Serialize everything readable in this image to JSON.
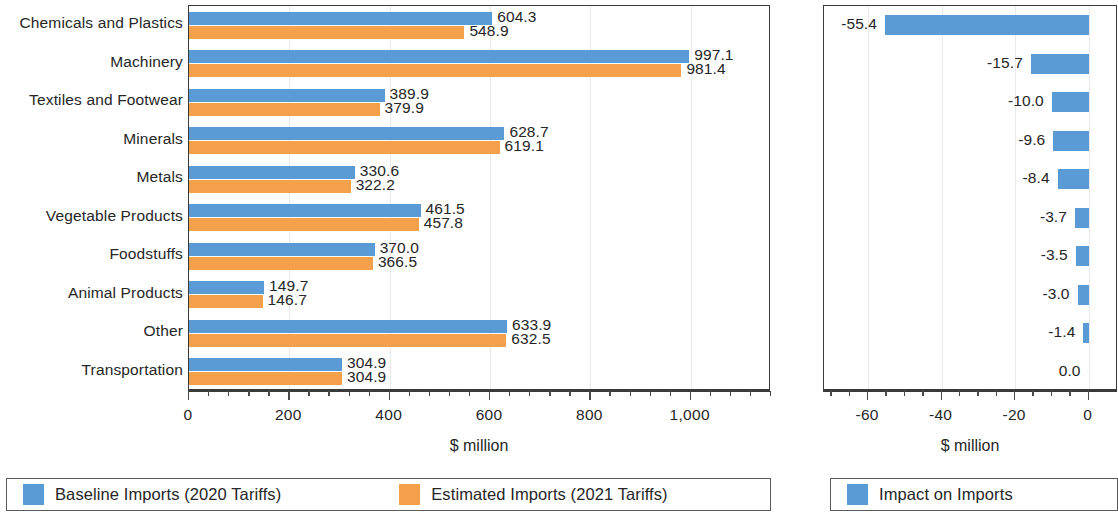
{
  "figure": {
    "left_panel_name": "imports-by-sector-chart",
    "right_panel_name": "impact-on-imports-chart"
  },
  "chart_data": [
    {
      "type": "bar",
      "orientation": "horizontal",
      "title": "",
      "xlabel": "$ million",
      "ylabel": "",
      "xlim": [
        0,
        1160
      ],
      "xticks": [
        0,
        200,
        400,
        600,
        800,
        1000
      ],
      "xticklabels": [
        "0",
        "200",
        "400",
        "600",
        "800",
        "1,000"
      ],
      "grid": true,
      "legend_position": "bottom",
      "categories": [
        "Chemicals and Plastics",
        "Machinery",
        "Textiles and Footwear",
        "Minerals",
        "Metals",
        "Vegetable Products",
        "Foodstuffs",
        "Animal Products",
        "Other",
        "Transportation"
      ],
      "series": [
        {
          "name": "Baseline Imports (2020 Tariffs)",
          "color": "#5B9BD5",
          "values": [
            604.3,
            997.1,
            389.9,
            628.7,
            330.6,
            461.5,
            370.0,
            149.7,
            633.9,
            304.9
          ],
          "labels": [
            "604.3",
            "997.1",
            "389.9",
            "628.7",
            "330.6",
            "461.5",
            "370.0",
            "149.7",
            "633.9",
            "304.9"
          ]
        },
        {
          "name": "Estimated Imports (2021 Tariffs)",
          "color": "#F5A04A",
          "values": [
            548.9,
            981.4,
            379.9,
            619.1,
            322.2,
            457.8,
            366.5,
            146.7,
            632.5,
            304.9
          ],
          "labels": [
            "548.9",
            "981.4",
            "379.9",
            "619.1",
            "322.2",
            "457.8",
            "366.5",
            "146.7",
            "632.5",
            "304.9"
          ]
        }
      ]
    },
    {
      "type": "bar",
      "orientation": "horizontal",
      "title": "",
      "xlabel": "$ million",
      "ylabel": "",
      "xlim": [
        -72,
        8
      ],
      "xticks": [
        -60,
        -40,
        -20,
        0
      ],
      "xticklabels": [
        "-60",
        "-40",
        "-20",
        "0"
      ],
      "grid": true,
      "legend_position": "bottom",
      "categories": [
        "Chemicals and Plastics",
        "Machinery",
        "Textiles and Footwear",
        "Minerals",
        "Metals",
        "Vegetable Products",
        "Foodstuffs",
        "Animal Products",
        "Other",
        "Transportation"
      ],
      "series": [
        {
          "name": "Impact on Imports",
          "color": "#5B9BD5",
          "values": [
            -55.4,
            -15.7,
            -10.0,
            -9.6,
            -8.4,
            -3.7,
            -3.5,
            -3.0,
            -1.4,
            0.0
          ],
          "labels": [
            "-55.4",
            "-15.7",
            "-10.0",
            "-9.6",
            "-8.4",
            "-3.7",
            "-3.5",
            "-3.0",
            "-1.4",
            "0.0"
          ]
        }
      ]
    }
  ],
  "left_chart": {
    "axis_title": "$ million",
    "tick_labels": [
      "0",
      "200",
      "400",
      "600",
      "800",
      "1,000"
    ],
    "category_labels": [
      "Chemicals and Plastics",
      "Machinery",
      "Textiles and Footwear",
      "Minerals",
      "Metals",
      "Vegetable Products",
      "Foodstuffs",
      "Animal Products",
      "Other",
      "Transportation"
    ],
    "baseline_labels": [
      "604.3",
      "997.1",
      "389.9",
      "628.7",
      "330.6",
      "461.5",
      "370.0",
      "149.7",
      "633.9",
      "304.9"
    ],
    "estimated_labels": [
      "548.9",
      "981.4",
      "379.9",
      "619.1",
      "322.2",
      "457.8",
      "366.5",
      "146.7",
      "632.5",
      "304.9"
    ],
    "legend": [
      {
        "label": "Baseline Imports (2020 Tariffs)",
        "color": "#5B9BD5",
        "swatch_name": "legend-swatch-baseline"
      },
      {
        "label": "Estimated Imports (2021 Tariffs)",
        "color": "#F5A04A",
        "swatch_name": "legend-swatch-estimated"
      }
    ]
  },
  "right_chart": {
    "axis_title": "$ million",
    "tick_labels": [
      "-60",
      "-40",
      "-20",
      "0"
    ],
    "value_labels": [
      "-55.4",
      "-15.7",
      "-10.0",
      "-9.6",
      "-8.4",
      "-3.7",
      "-3.5",
      "-3.0",
      "-1.4",
      "0.0"
    ],
    "legend": [
      {
        "label": "Impact on Imports",
        "color": "#5B9BD5",
        "swatch_name": "legend-swatch-impact"
      }
    ]
  }
}
